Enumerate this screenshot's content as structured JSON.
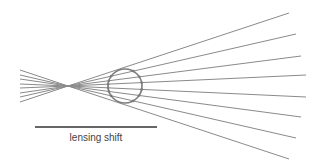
{
  "diagram": {
    "label": "lensing shift",
    "colors": {
      "ray": "#8a8a8a",
      "circle": "#7d7d7d",
      "bar": "#333333",
      "text": "#444444"
    },
    "focus": {
      "x": 68,
      "y": 86
    },
    "left_rays": [
      {
        "x1": 20,
        "y1": 70
      },
      {
        "x1": 20,
        "y1": 75
      },
      {
        "x1": 20,
        "y1": 79
      },
      {
        "x1": 20,
        "y1": 84
      },
      {
        "x1": 20,
        "y1": 88
      },
      {
        "x1": 20,
        "y1": 93
      },
      {
        "x1": 20,
        "y1": 97
      },
      {
        "x1": 20,
        "y1": 102
      }
    ],
    "right_rays": [
      {
        "x2": 289,
        "y2": 13
      },
      {
        "x2": 296,
        "y2": 34
      },
      {
        "x2": 301,
        "y2": 56
      },
      {
        "x2": 306,
        "y2": 75
      },
      {
        "x2": 306,
        "y2": 97
      },
      {
        "x2": 301,
        "y2": 117
      },
      {
        "x2": 296,
        "y2": 138
      },
      {
        "x2": 289,
        "y2": 159
      }
    ],
    "circle": {
      "cx": 125,
      "cy": 86,
      "r": 17
    },
    "shift_bar": {
      "x1": 35,
      "x2": 157,
      "y": 127
    }
  }
}
